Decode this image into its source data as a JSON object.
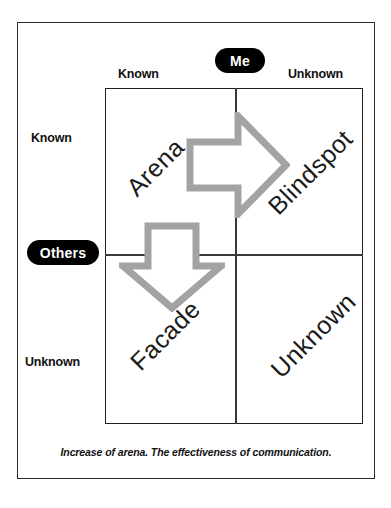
{
  "diagram": {
    "caption": "Increase of arena. The effectiveness of communication.",
    "colors": {
      "frame": "#2b2b2b",
      "grid": "#1d1d1d",
      "badge_bg": "#000000",
      "badge_text": "#ffffff",
      "arrow": "#a3a3a3",
      "text": "#111111"
    }
  },
  "badges": {
    "top": "Me",
    "left": "Others"
  },
  "axes": {
    "top": {
      "left_label": "Known",
      "right_label": "Unknown"
    },
    "left": {
      "top_label": "Known",
      "bottom_label": "Unknown"
    }
  },
  "quadrants": [
    {
      "key": "arena",
      "label": "Arena",
      "me": "Known",
      "others": "Known"
    },
    {
      "key": "blindspot",
      "label": "Blindspot",
      "me": "Unknown",
      "others": "Known"
    },
    {
      "key": "facade",
      "label": "Facade",
      "me": "Known",
      "others": "Unknown"
    },
    {
      "key": "unknown",
      "label": "Unknown",
      "me": "Unknown",
      "others": "Unknown"
    }
  ],
  "arrows": [
    {
      "key": "arrow-right",
      "direction": "right",
      "meaning": "Arena expands into Blindspot"
    },
    {
      "key": "arrow-down",
      "direction": "down",
      "meaning": "Arena expands into Facade"
    }
  ]
}
